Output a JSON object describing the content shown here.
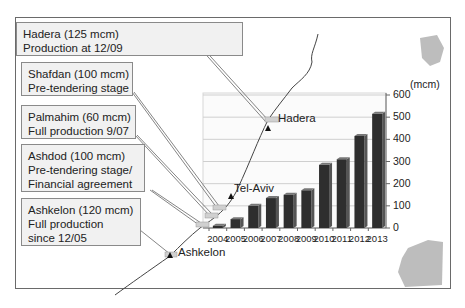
{
  "callouts": [
    {
      "name": "Hadera (125 mcm)",
      "status": "Production at 12/09"
    },
    {
      "name": "Shafdan (100 mcm)",
      "status": "Pre-tendering stage"
    },
    {
      "name": "Palmahim (60 mcm)",
      "status": "Full production 9/07"
    },
    {
      "name": "Ashdod (100 mcm)",
      "status": "Pre-tendering stage/",
      "status2": "Financial agreement"
    },
    {
      "name": "Ashkelon (120 mcm)",
      "status": "Full production",
      "status2": "since 12/05"
    }
  ],
  "cities": {
    "hadera": "Hadera",
    "tel_aviv": "Tel-Aviv",
    "ashkelon": "Ashkelon"
  },
  "colors": {
    "bar": "#2e2e2e",
    "bar_side": "#555555",
    "grid": "#cfcfcf",
    "callout_bg": "#f1f1f1",
    "land": "#b8b8b8"
  },
  "chart_data": {
    "type": "bar",
    "title": "",
    "xlabel": "",
    "ylabel": "(mcm)",
    "categories": [
      "2004",
      "2005",
      "2006",
      "2007",
      "2008",
      "2009",
      "2010",
      "2011",
      "2012",
      "2013"
    ],
    "values": [
      10,
      40,
      100,
      135,
      150,
      170,
      285,
      310,
      415,
      515
    ],
    "ylim": [
      0,
      600
    ],
    "yticks": [
      "0",
      "100",
      "200",
      "300",
      "400",
      "500",
      "600"
    ],
    "grid": true,
    "legend": "none"
  }
}
